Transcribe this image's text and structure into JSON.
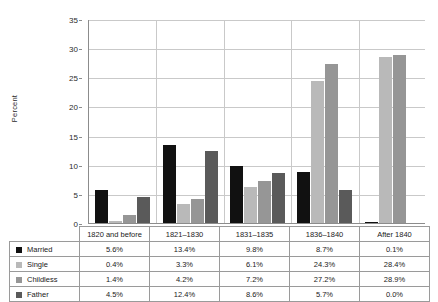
{
  "chart_data": {
    "type": "bar",
    "title": "",
    "xlabel": "",
    "ylabel": "Percent",
    "ylim": [
      0,
      35
    ],
    "ytick_step": 5,
    "yticks": [
      "0",
      "5",
      "10",
      "15",
      "20",
      "25",
      "30",
      "35"
    ],
    "grid": true,
    "legend_position": "table-left",
    "categories": [
      "1820 and before",
      "1821–1830",
      "1831–1835",
      "1836–1840",
      "After 1840"
    ],
    "series": [
      {
        "name": "Married",
        "color": "#111111",
        "values": [
          5.6,
          13.4,
          9.8,
          8.7,
          0.1
        ],
        "labels": [
          "5.6%",
          "13.4%",
          "9.8%",
          "8.7%",
          "0.1%"
        ]
      },
      {
        "name": "Single",
        "color": "#b9b9b9",
        "values": [
          0.4,
          3.3,
          6.1,
          24.3,
          28.4
        ],
        "labels": [
          "0.4%",
          "3.3%",
          "6.1%",
          "24.3%",
          "28.4%"
        ]
      },
      {
        "name": "Childless",
        "color": "#969696",
        "values": [
          1.4,
          4.2,
          7.2,
          27.2,
          28.9
        ],
        "labels": [
          "1.4%",
          "4.2%",
          "7.2%",
          "27.2%",
          "28.9%"
        ]
      },
      {
        "name": "Father",
        "color": "#5a5a5a",
        "values": [
          4.5,
          12.4,
          8.6,
          5.7,
          0.0
        ],
        "labels": [
          "4.5%",
          "12.4%",
          "8.6%",
          "5.7%",
          "0.0%"
        ]
      }
    ]
  },
  "table": {
    "corner_label": ""
  }
}
